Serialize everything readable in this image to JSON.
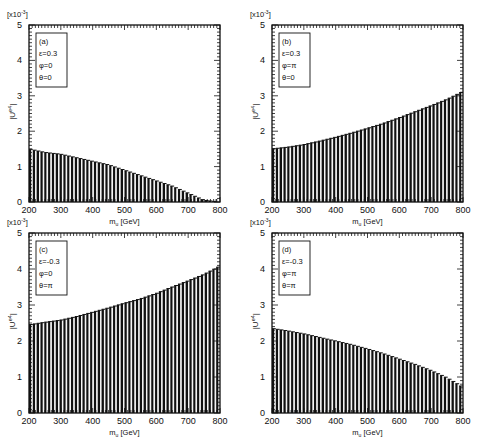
{
  "figure": {
    "x_axis_label": "m_u [GeV]",
    "y_axis_label": "|U^e4|",
    "y_scale_label": "[x10^-3]"
  },
  "chart_data": [
    {
      "type": "bar",
      "panel": "(a)",
      "legend": [
        "(a)",
        "ε=0.3",
        "φ=0",
        "θ=0"
      ],
      "xlabel": "m_u [GeV]",
      "ylabel": "|U^e4|",
      "y_multiplier": "x10^-3",
      "xlim": [
        200,
        800
      ],
      "ylim": [
        0,
        5
      ],
      "xticks": [
        200,
        300,
        400,
        500,
        600,
        700,
        800
      ],
      "yticks": [
        0,
        1,
        2,
        3,
        4,
        5
      ],
      "x": [
        200,
        250,
        300,
        350,
        400,
        450,
        500,
        550,
        600,
        650,
        700,
        750,
        800
      ],
      "values": [
        1.5,
        1.4,
        1.35,
        1.25,
        1.15,
        1.05,
        0.9,
        0.75,
        0.6,
        0.45,
        0.25,
        0.05,
        0.0
      ]
    },
    {
      "type": "bar",
      "panel": "(b)",
      "legend": [
        "(b)",
        "ε=0.3",
        "φ=π",
        "θ=0"
      ],
      "xlabel": "m_u [GeV]",
      "ylabel": "|U^e4|",
      "y_multiplier": "x10^-3",
      "xlim": [
        200,
        800
      ],
      "ylim": [
        0,
        5
      ],
      "xticks": [
        200,
        300,
        400,
        500,
        600,
        700,
        800
      ],
      "yticks": [
        0,
        1,
        2,
        3,
        4,
        5
      ],
      "x": [
        200,
        250,
        300,
        350,
        400,
        450,
        500,
        550,
        600,
        650,
        700,
        750,
        800
      ],
      "values": [
        1.5,
        1.55,
        1.62,
        1.72,
        1.83,
        1.95,
        2.08,
        2.22,
        2.38,
        2.55,
        2.72,
        2.9,
        3.12
      ]
    },
    {
      "type": "bar",
      "panel": "(c)",
      "legend": [
        "(c)",
        "ε=-0.3",
        "φ=0",
        "θ=π"
      ],
      "xlabel": "m_u [GeV]",
      "ylabel": "|U^e4|",
      "y_multiplier": "x10^-3",
      "xlim": [
        200,
        800
      ],
      "ylim": [
        0,
        5
      ],
      "xticks": [
        200,
        300,
        400,
        500,
        600,
        700,
        800
      ],
      "yticks": [
        0,
        1,
        2,
        3,
        4,
        5
      ],
      "x": [
        200,
        250,
        300,
        350,
        400,
        450,
        500,
        550,
        600,
        650,
        700,
        750,
        800
      ],
      "values": [
        2.45,
        2.52,
        2.58,
        2.68,
        2.8,
        2.92,
        3.05,
        3.17,
        3.32,
        3.5,
        3.67,
        3.85,
        4.08
      ]
    },
    {
      "type": "bar",
      "panel": "(d)",
      "legend": [
        "(d)",
        "ε=-0.3",
        "φ=π",
        "θ=π"
      ],
      "xlabel": "m_u [GeV]",
      "ylabel": "|U^e4|",
      "y_multiplier": "x10^-3",
      "xlim": [
        200,
        800
      ],
      "ylim": [
        0,
        5
      ],
      "xticks": [
        200,
        300,
        400,
        500,
        600,
        700,
        800
      ],
      "yticks": [
        0,
        1,
        2,
        3,
        4,
        5
      ],
      "x": [
        200,
        250,
        300,
        350,
        400,
        450,
        500,
        550,
        600,
        650,
        700,
        750,
        800
      ],
      "values": [
        2.35,
        2.28,
        2.2,
        2.1,
        2.0,
        1.9,
        1.78,
        1.65,
        1.5,
        1.35,
        1.18,
        0.98,
        0.72
      ]
    }
  ],
  "layout": {
    "panels": [
      {
        "left": 29,
        "top": 25,
        "right": 220,
        "bottom": 202,
        "xlabel_visible": true
      },
      {
        "left": 272,
        "top": 25,
        "right": 463,
        "bottom": 202,
        "xlabel_visible": true
      },
      {
        "left": 29,
        "top": 233,
        "right": 220,
        "bottom": 413,
        "xlabel_visible": true
      },
      {
        "left": 272,
        "top": 233,
        "right": 463,
        "bottom": 413,
        "xlabel_visible": true
      }
    ]
  }
}
